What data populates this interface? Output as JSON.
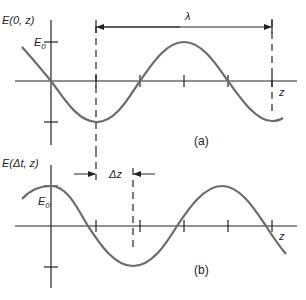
{
  "figure": {
    "panel_a": {
      "y_axis_label": "E(0, z)",
      "amplitude_label": "E",
      "amplitude_subscript": "0",
      "x_axis_label": "z",
      "wavelength_label": "λ",
      "panel_label": "(a)"
    },
    "panel_b": {
      "y_axis_label": "E(Δt, z)",
      "amplitude_label": "E",
      "amplitude_subscript": "0",
      "x_axis_label": "z",
      "shift_label": "Δz",
      "panel_label": "(b)"
    },
    "colors": {
      "curve": "#6b6b6b",
      "axis": "#222222"
    }
  }
}
